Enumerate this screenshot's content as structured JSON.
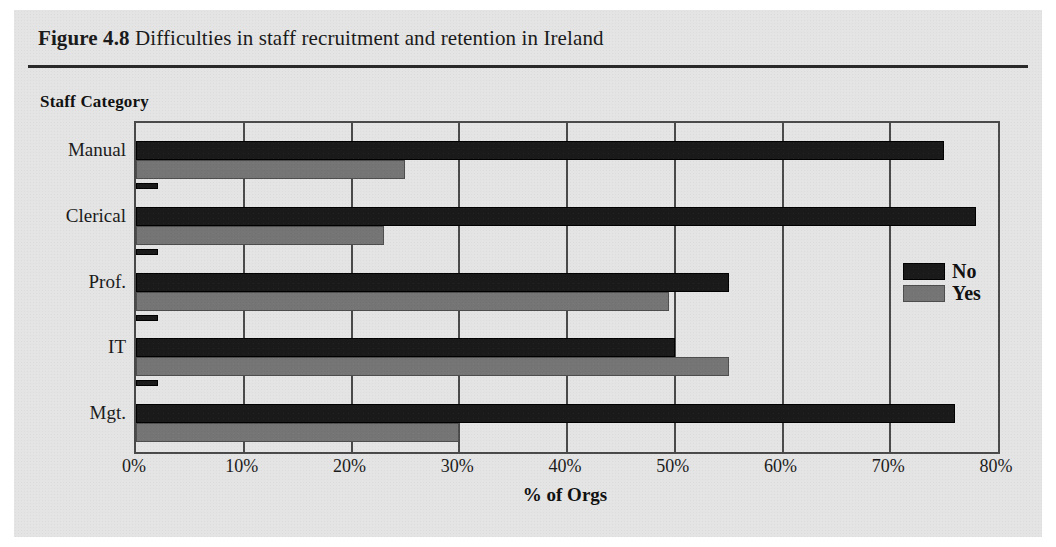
{
  "figure": {
    "number": "Figure 4.8",
    "title_text": "Difficulties in staff recruitment and retention in Ireland",
    "group_axis_title": "Staff Category"
  },
  "legend": {
    "position": "inside-right",
    "items": [
      {
        "label": "No",
        "color": "#1a1a1a",
        "swatch": "no"
      },
      {
        "label": "Yes",
        "color": "#757575",
        "swatch": "yes"
      }
    ]
  },
  "chart_data": {
    "type": "bar",
    "orientation": "horizontal",
    "title": "Figure 4.8 Difficulties in staff recruitment and retention in Ireland",
    "xlabel": "% of Orgs",
    "ylabel": "Staff Category",
    "xlim": [
      0,
      80
    ],
    "xticks": [
      0,
      10,
      20,
      30,
      40,
      50,
      60,
      70,
      80
    ],
    "xtick_labels": [
      "0%",
      "10%",
      "20%",
      "30%",
      "40%",
      "50%",
      "60%",
      "70%",
      "80%"
    ],
    "grid": true,
    "legend_position": "inside-right",
    "categories": [
      "Manual",
      "Clerical",
      "Prof.",
      "IT",
      "Mgt."
    ],
    "series": [
      {
        "name": "No",
        "color": "#1a1a1a",
        "values": [
          75,
          78,
          55,
          50,
          76
        ]
      },
      {
        "name": "Yes",
        "color": "#757575",
        "values": [
          25,
          23,
          49.5,
          55,
          30
        ]
      },
      {
        "name": "Other",
        "color": "#1a1a1a",
        "values": [
          2,
          2,
          2,
          2,
          0
        ]
      }
    ]
  }
}
